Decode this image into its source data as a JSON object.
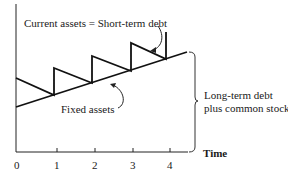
{
  "diagram": {
    "annotations": {
      "current_assets": "Current assets = Short-term debt",
      "fixed_assets": "Fixed assets",
      "long_term_line1": "Long-term debt",
      "long_term_line2": "plus common stock"
    },
    "x_axis": {
      "label": "Time",
      "ticks": [
        "0",
        "1",
        "2",
        "3",
        "4"
      ]
    },
    "colors": {
      "line": "#111111",
      "text": "#1a1a1a",
      "background": "#ffffff"
    }
  }
}
